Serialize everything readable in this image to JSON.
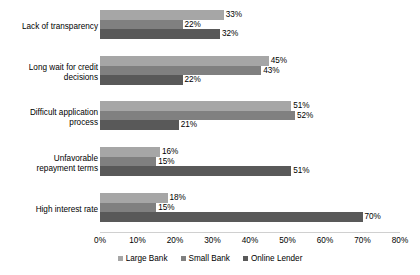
{
  "chart_data": {
    "type": "bar",
    "orientation": "horizontal",
    "title": "",
    "xlabel": "",
    "ylabel": "",
    "xlim": [
      0,
      80
    ],
    "xticks": [
      "0%",
      "10%",
      "20%",
      "30%",
      "40%",
      "50%",
      "60%",
      "70%",
      "80%"
    ],
    "xtick_values": [
      0,
      10,
      20,
      30,
      40,
      50,
      60,
      70,
      80
    ],
    "grid": false,
    "legend_position": "bottom",
    "categories": [
      "Lack of transparency",
      "Long wait for credit decisions",
      "Difficult application process",
      "Unfavorable repayment terms",
      "High interest rate"
    ],
    "category_lines": [
      [
        "Lack of transparency"
      ],
      [
        "Long wait for credit",
        "decisions"
      ],
      [
        "Difficult application",
        "process"
      ],
      [
        "Unfavorable",
        "repayment terms"
      ],
      [
        "High interest rate"
      ]
    ],
    "series": [
      {
        "name": "Large Bank",
        "color": "#a6a6a6",
        "values": [
          33,
          45,
          51,
          16,
          18
        ],
        "labels": [
          "33%",
          "45%",
          "51%",
          "16%",
          "18%"
        ]
      },
      {
        "name": "Small Bank",
        "color": "#808080",
        "values": [
          22,
          43,
          52,
          15,
          15
        ],
        "labels": [
          "22%",
          "43%",
          "52%",
          "15%",
          "15%"
        ]
      },
      {
        "name": "Online Lender",
        "color": "#595959",
        "values": [
          32,
          22,
          21,
          51,
          70
        ],
        "labels": [
          "32%",
          "22%",
          "21%",
          "51%",
          "70%"
        ]
      }
    ]
  }
}
